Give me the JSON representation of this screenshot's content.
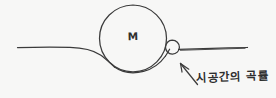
{
  "diagram": {
    "style": "hand-drawn pencil sketch",
    "background_color": "#f7f7f6",
    "ink_color": "#3b3b3b",
    "mass": {
      "label": "M",
      "icon": "large-circle",
      "center_x": 133,
      "center_y": 38,
      "radius": 33.5
    },
    "test_body": {
      "label": "",
      "icon": "small-circle",
      "center_x": 172,
      "center_y": 47,
      "radius": 7
    },
    "sheet": {
      "icon": "curved-line",
      "description": "horizontal spacetime line dipping beneath the mass",
      "left_x": 17,
      "right_x": 248,
      "baseline_y": 48
    },
    "annotation": {
      "arrow_icon": "arrow-up-left",
      "text": "시공간의 곡률"
    }
  }
}
